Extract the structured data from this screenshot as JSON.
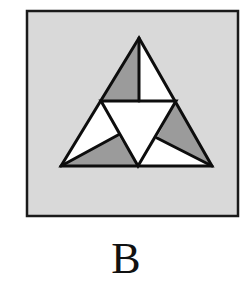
{
  "figure": {
    "label": "B",
    "colors": {
      "box_fill": "#d9d9d9",
      "box_stroke": "#1a1a1a",
      "shade": "#9b9b9b",
      "light": "#ffffff",
      "stroke": "#0d0d0d"
    },
    "box": {
      "x": 27,
      "y": 11,
      "width": 211,
      "height": 205
    },
    "triangle": {
      "apex": [
        139,
        38
      ],
      "bottom_left": [
        61,
        166
      ],
      "bottom_right": [
        212,
        166
      ]
    },
    "regions": [
      {
        "name": "top-left",
        "fill": "shade",
        "points": "139,38 101,101 139,101"
      },
      {
        "name": "top-right",
        "fill": "light",
        "points": "139,38 139,101 176,101"
      },
      {
        "name": "left-upper",
        "fill": "light",
        "points": "101,101 61,166 118,135"
      },
      {
        "name": "left-lower",
        "fill": "shade",
        "points": "61,166 138,166 118,135"
      },
      {
        "name": "right-upper",
        "fill": "shade",
        "points": "176,101 157,138 212,166"
      },
      {
        "name": "right-lower",
        "fill": "light",
        "points": "157,138 138,166 212,166"
      },
      {
        "name": "center",
        "fill": "light",
        "points": "101,101 176,101 138,166"
      }
    ]
  }
}
